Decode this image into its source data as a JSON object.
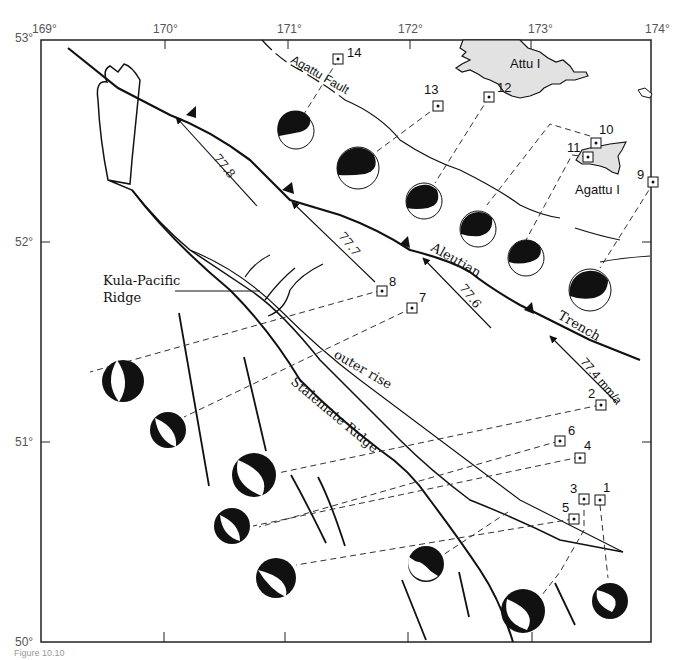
{
  "map": {
    "title": "Aleutian Trench near Attu and Agattu Islands — earthquake focal mechanisms",
    "axes": {
      "longitude_ticks": [
        "169°",
        "170°",
        "171°",
        "172°",
        "173°",
        "174°"
      ],
      "latitude_ticks": [
        "53°",
        "52°",
        "51°",
        "50°"
      ]
    },
    "labels": {
      "attu": "Attu I",
      "agattu": "Agattu I",
      "agattu_fault": "Agattu Fault",
      "aleutian": "Aleutian",
      "trench": "Trench",
      "kula_pacific_1": "Kula-Pacific",
      "kula_pacific_2": "Ridge",
      "outer_rise": "outer rise",
      "stalemate_ridge": "Stalemate Ridge"
    },
    "velocity_vectors": [
      {
        "label": "77.8"
      },
      {
        "label": "77.7"
      },
      {
        "label": "77.6"
      },
      {
        "label": "77.4 mm/a"
      }
    ],
    "event_markers": [
      {
        "id": "1"
      },
      {
        "id": "2"
      },
      {
        "id": "3"
      },
      {
        "id": "4"
      },
      {
        "id": "5"
      },
      {
        "id": "6"
      },
      {
        "id": "7"
      },
      {
        "id": "8"
      },
      {
        "id": "9"
      },
      {
        "id": "10"
      },
      {
        "id": "11"
      },
      {
        "id": "12"
      },
      {
        "id": "13"
      },
      {
        "id": "14"
      }
    ],
    "colors": {
      "line": "#111111",
      "island_fill": "#e2e2e2",
      "beachball_fill": "#000000",
      "frame": "#222222",
      "tick_text": "#555555"
    },
    "caption": "Figure 10.10"
  }
}
